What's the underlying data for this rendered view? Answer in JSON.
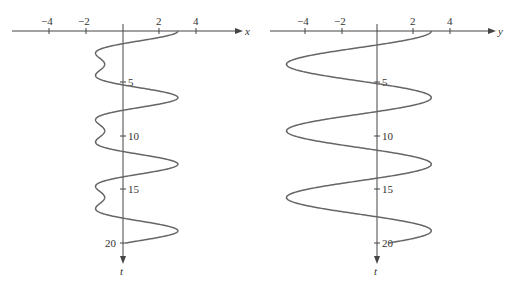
{
  "chart_data": [
    {
      "type": "line",
      "title": "",
      "xlabel": "x",
      "ylabel": "t",
      "orientation": "t axis points downward",
      "x_ticks": [
        "-4",
        "-2",
        "2",
        "4"
      ],
      "t_ticks": [
        "5",
        "10",
        "15",
        "20"
      ],
      "function": "x = 2cos t + cos 2t",
      "t_range": [
        0,
        20
      ],
      "x_range_shown": [
        -5,
        6
      ],
      "grid": false,
      "color": "#666666"
    },
    {
      "type": "line",
      "title": "",
      "xlabel": "y",
      "ylabel": "t",
      "orientation": "t axis points downward",
      "x_ticks": [
        "-4",
        "-2",
        "2",
        "4"
      ],
      "t_ticks": [
        "5",
        "10",
        "15",
        "20"
      ],
      "function": "y ≈ 4cos t − 1",
      "t_range": [
        0,
        20
      ],
      "x_range_shown": [
        -5,
        6
      ],
      "grid": false,
      "color": "#666666"
    }
  ],
  "labels": {
    "left": {
      "axis_h": "x",
      "axis_v": "t",
      "ticks_h": [
        "−4",
        "−2",
        "2",
        "4"
      ],
      "ticks_v": [
        "5",
        "10",
        "15",
        "20"
      ]
    },
    "right": {
      "axis_h": "y",
      "axis_v": "t",
      "ticks_h": [
        "−4",
        "−2",
        "2",
        "4"
      ],
      "ticks_v": [
        "5",
        "10",
        "15",
        "20"
      ]
    }
  }
}
